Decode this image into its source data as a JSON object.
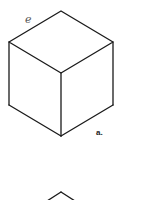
{
  "figure": {
    "edge_label": "e",
    "cube_a_label": "a.",
    "stroke_color": "#1a1a1a"
  },
  "cube_a": {
    "vertices": {
      "top": [
        61,
        11
      ],
      "left_top": [
        9,
        42
      ],
      "right_top": [
        113,
        42
      ],
      "center": [
        61,
        73
      ],
      "left_bottom": [
        9,
        105
      ],
      "right_bottom": [
        113,
        105
      ],
      "bottom": [
        61,
        136
      ]
    }
  },
  "cube_b": {
    "visible_top_vertex": [
      61,
      192
    ]
  }
}
